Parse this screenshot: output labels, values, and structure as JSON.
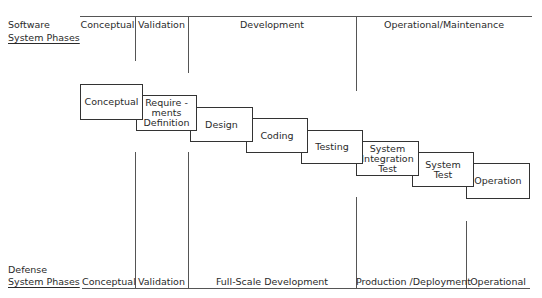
{
  "software_phases": {
    "title_line1": "Software",
    "title_line2": "System Phases",
    "columns": [
      {
        "label": "Conceptual"
      },
      {
        "label": "Validation"
      },
      {
        "label": "Development"
      },
      {
        "label": "Operational/Maintenance"
      }
    ]
  },
  "waterfall": {
    "steps": [
      {
        "lines": [
          "Conceptual"
        ]
      },
      {
        "lines": [
          "Require -",
          "ments",
          "Definition"
        ]
      },
      {
        "lines": [
          "Design"
        ]
      },
      {
        "lines": [
          "Coding"
        ]
      },
      {
        "lines": [
          "Testing"
        ]
      },
      {
        "lines": [
          "System",
          "Integration",
          "Test"
        ]
      },
      {
        "lines": [
          "System",
          "Test"
        ]
      },
      {
        "lines": [
          "Operation"
        ]
      }
    ]
  },
  "defense_phases": {
    "title_line1": "Defense",
    "title_line2": "System Phases",
    "columns": [
      {
        "label": "Conceptual"
      },
      {
        "label": "Validation"
      },
      {
        "label": "Full-Scale Development"
      },
      {
        "label": "Production /Deployment"
      },
      {
        "label": "Operational"
      }
    ]
  }
}
